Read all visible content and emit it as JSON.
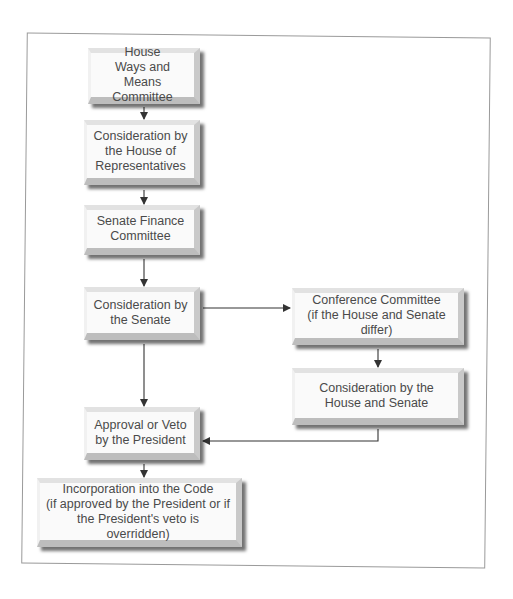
{
  "diagram": {
    "type": "flowchart",
    "title": "",
    "nodes": [
      {
        "id": "house_wm",
        "label": "House\nWays and Means\nCommittee"
      },
      {
        "id": "house_consider",
        "label": "Consideration by\nthe House of\nRepresentatives"
      },
      {
        "id": "senate_finance",
        "label": "Senate Finance\nCommittee"
      },
      {
        "id": "senate_consider",
        "label": "Consideration by\nthe Senate"
      },
      {
        "id": "conference",
        "label": "Conference Committee\n(if the House and Senate differ)"
      },
      {
        "id": "house_senate_consider",
        "label": "Consideration by the\nHouse and Senate"
      },
      {
        "id": "president",
        "label": "Approval or Veto\nby the President"
      },
      {
        "id": "code",
        "label": "Incorporation into the Code\n(if approved by the President or if\nthe President's veto is overridden)"
      }
    ],
    "edges": [
      {
        "from": "house_wm",
        "to": "house_consider"
      },
      {
        "from": "house_consider",
        "to": "senate_finance"
      },
      {
        "from": "senate_finance",
        "to": "senate_consider"
      },
      {
        "from": "senate_consider",
        "to": "conference"
      },
      {
        "from": "senate_consider",
        "to": "president"
      },
      {
        "from": "conference",
        "to": "house_senate_consider"
      },
      {
        "from": "house_senate_consider",
        "to": "president"
      },
      {
        "from": "president",
        "to": "code"
      }
    ]
  },
  "colors": {
    "frame": "#9a9a9a",
    "box_face": "#fafafa",
    "text": "#4a4a4a",
    "arrow": "#333333"
  }
}
